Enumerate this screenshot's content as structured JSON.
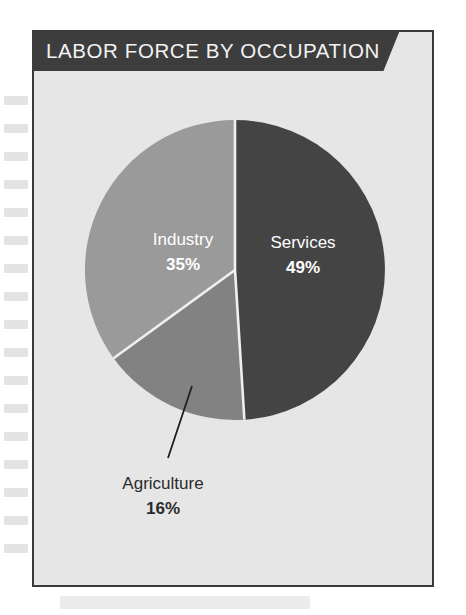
{
  "header": {
    "title": "LABOR FORCE BY OCCUPATION",
    "background_color": "#3d3d3d",
    "text_color": "#f2f2f2"
  },
  "card": {
    "background_color": "#e6e6e6",
    "border_color": "#3a3a3a"
  },
  "chart_data": {
    "type": "pie",
    "title": "LABOR FORCE BY OCCUPATION",
    "xlabel": "",
    "ylabel": "",
    "start_angle_deg": 0,
    "direction": "clockwise",
    "categories": [
      "Services",
      "Agriculture",
      "Industry"
    ],
    "values": [
      49,
      16,
      35
    ],
    "unit": "%",
    "colors": [
      "#444444",
      "#828282",
      "#9a9a9a"
    ],
    "separator_color": "#f0f0f0",
    "legend": "none",
    "grid": false,
    "slices": [
      {
        "label": "Services",
        "value": 49,
        "value_label": "49%",
        "color": "#444444",
        "label_color": "#ffffff",
        "label_position": "inside",
        "start_angle_deg": 0,
        "end_angle_deg": 176.4
      },
      {
        "label": "Agriculture",
        "value": 16,
        "value_label": "16%",
        "color": "#828282",
        "label_color": "#2b2b2b",
        "label_position": "outside",
        "leader_line": true,
        "start_angle_deg": 176.4,
        "end_angle_deg": 234.0
      },
      {
        "label": "Industry",
        "value": 35,
        "value_label": "35%",
        "color": "#9a9a9a",
        "label_color": "#ffffff",
        "label_position": "inside",
        "start_angle_deg": 234.0,
        "end_angle_deg": 360.0
      }
    ]
  }
}
